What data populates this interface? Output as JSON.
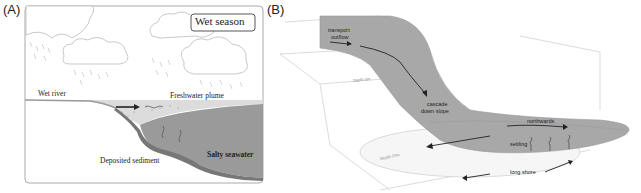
{
  "panels": [
    {
      "label": "(A)",
      "title_box": "Wet season",
      "labels": {
        "wet_river": "Wet river",
        "freshwater_plume": "Freshwater plume",
        "deposited_sediment": "Deposited sediment",
        "salty_seawater": "Salty seawater"
      }
    },
    {
      "label": "(B)",
      "labels": {
        "transport_outflow_1": "transport",
        "transport_outflow_2": "outflow",
        "cascade_1": "cascade",
        "cascade_2": "down slope",
        "northwards": "northwards",
        "settling": "settling",
        "long_shore": "long shore",
        "depth_5m": "Depth 5m",
        "depth_10m": "Depth 10m"
      }
    }
  ],
  "colors": {
    "seawater": "#9a9a9a",
    "plume": "#d6d6d6",
    "sediment": "#7a7a7a",
    "flow_band": "#a8a8a8",
    "frame": "#9a9a9a"
  }
}
